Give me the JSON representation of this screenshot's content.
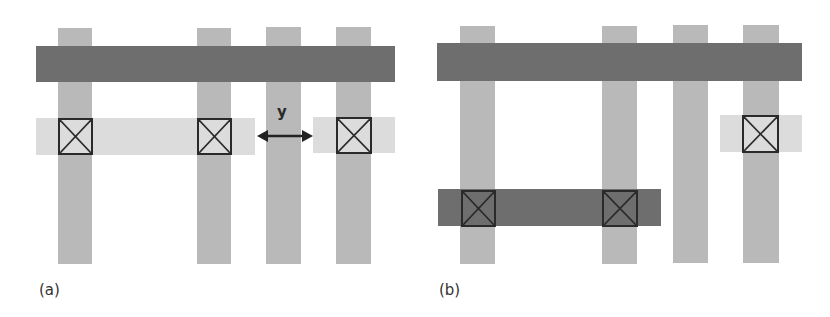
{
  "figure": {
    "panels": [
      {
        "id": "a",
        "caption": "(a)",
        "dimension_label": "y"
      },
      {
        "id": "b",
        "caption": "(b)"
      }
    ],
    "colors": {
      "vertical_bar": "#b9b9b9",
      "dark_bar": "#6e6e6e",
      "light_strip": "#dcdcdc",
      "contact_outline": "#2a2a2a",
      "background": "#ffffff"
    }
  }
}
